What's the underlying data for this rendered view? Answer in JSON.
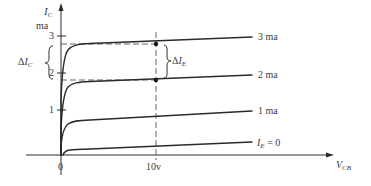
{
  "diagram": {
    "y_axis": {
      "symbol": "I",
      "subscript": "C",
      "unit": "ma",
      "ticks": [
        "3",
        "2",
        "1"
      ]
    },
    "x_axis": {
      "symbol": "V",
      "subscript": "CB",
      "ticks": [
        "0",
        "10v"
      ]
    },
    "curves": [
      {
        "label": "3 ma",
        "param": "I_E = 3 ma"
      },
      {
        "label": "2 ma",
        "param": "I_E = 2 ma"
      },
      {
        "label": "1 ma",
        "param": "I_E = 1 ma"
      },
      {
        "label_symbol": "I",
        "label_subscript": "E",
        "label_rest": " = 0",
        "param": "I_E = 0"
      }
    ],
    "annotations": {
      "delta_ic": {
        "delta": "Δ",
        "symbol": "I",
        "subscript": "C"
      },
      "delta_ie": {
        "delta": "Δ",
        "symbol": "I",
        "subscript": "E"
      }
    },
    "colors": {
      "line": "#2a2a2a",
      "text": "#3a3a3a",
      "dashed": "#555555"
    }
  }
}
